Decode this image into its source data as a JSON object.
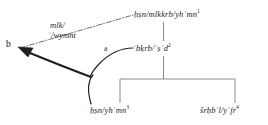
{
  "diagram": {
    "ink_color": "#1f1f1f",
    "line_color": "#6f6f6f",
    "background": "#ffffff"
  },
  "nodes": {
    "top": {
      "text": "ḥṣn/mlkkrb/yhʿmn",
      "note": "1"
    },
    "middle": {
      "text": "ʾbḳrb/ʾṣʿd",
      "note": "2"
    },
    "bottom_left": {
      "text": "ḥṣn/yhʿmn",
      "note": "3"
    },
    "bottom_right": {
      "text": "šrḥbʾl/yʿfr",
      "note": "4"
    }
  },
  "edge_labels": {
    "line1": "mlk/",
    "line2": "ʾ/wymnt"
  },
  "markers": {
    "arrow_target": "b",
    "curve_label": "a"
  }
}
